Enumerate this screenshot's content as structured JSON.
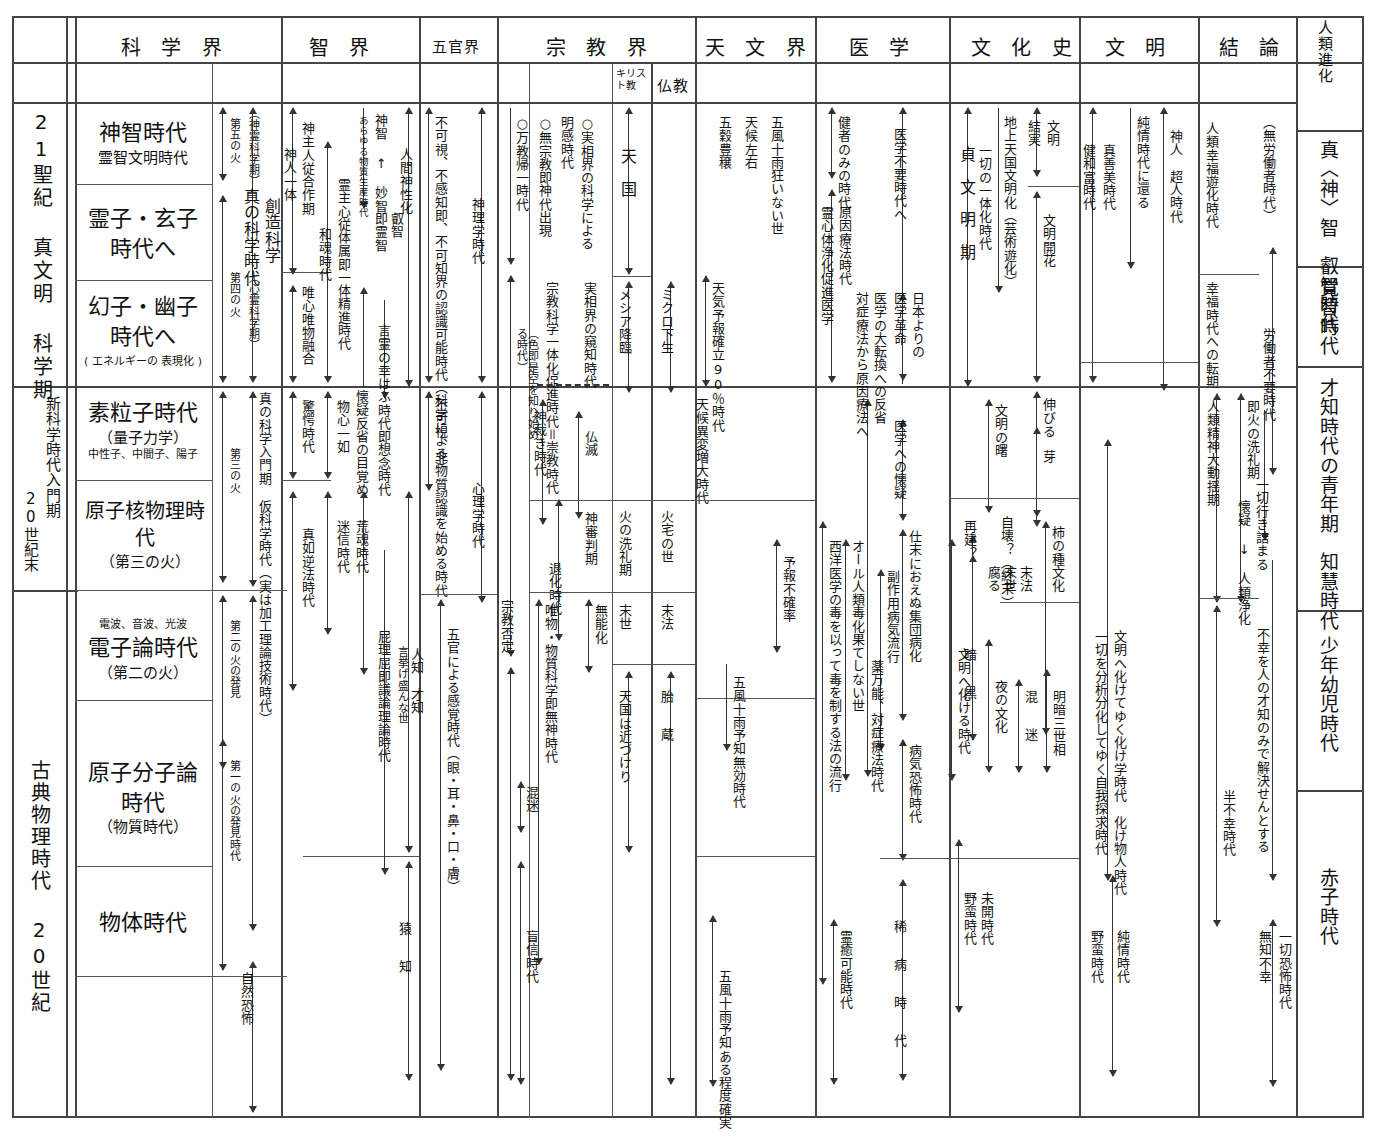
{
  "chart_title": "人類進化・文明段階比較年表",
  "columns": {
    "era_left": "",
    "headers": [
      {
        "id": "science",
        "label": "科 学 界"
      },
      {
        "id": "wisdom",
        "label": "智   界"
      },
      {
        "id": "senses",
        "label": "五官界"
      },
      {
        "id": "religion",
        "label": "宗 教 界"
      },
      {
        "id": "astronomy",
        "label": "天 文 界"
      },
      {
        "id": "medicine",
        "label": "医 学"
      },
      {
        "id": "culture",
        "label": "文 化 史"
      },
      {
        "id": "civilization",
        "label": "文 明"
      },
      {
        "id": "conclusion",
        "label": "結 論"
      },
      {
        "id": "evolution",
        "label": "人類進化"
      }
    ],
    "sub_headers": [
      {
        "id": "christianity",
        "label": "キリスト教"
      },
      {
        "id": "buddhism",
        "label": "仏教"
      }
    ]
  },
  "era_column": {
    "rows": [
      {
        "id": "era-21c",
        "label": "21聖紀 真文明 科学期"
      },
      {
        "id": "era-new-science",
        "label": "新科学時代入門期"
      },
      {
        "id": "era-20c-end",
        "label": "20世紀末"
      },
      {
        "id": "era-classical",
        "label": "古典物理時代  20世紀"
      }
    ]
  },
  "science_column": {
    "cells": [
      {
        "id": "sc-1",
        "l1": "神智時代",
        "l2": "霊智文明時代",
        "l3": ""
      },
      {
        "id": "sc-2",
        "l1": "霊子・玄子",
        "l1b": "時代へ",
        "l2": "",
        "l3": ""
      },
      {
        "id": "sc-3",
        "l1": "幻子・幽子",
        "l1b": "時代へ",
        "l3": "( エネルギーの 表現化 )"
      },
      {
        "id": "sc-4",
        "l1": "素粒子時代",
        "l2": "（量子力学）",
        "l3": "中性子、中間子、陽子"
      },
      {
        "id": "sc-5",
        "l1": "原子核物理時代",
        "l2": "（第三の火）",
        "l3": ""
      },
      {
        "id": "sc-6",
        "l1": "電子論時代",
        "l2": "（第二の火）",
        "l3": "電波、音波、光波"
      },
      {
        "id": "sc-7",
        "l1": "原子分子論",
        "l1b": "時代",
        "l2": "（物質時代）",
        "l3": ""
      },
      {
        "id": "sc-8",
        "l1": "物体時代",
        "l2": "",
        "l3": ""
      }
    ],
    "annotations": [
      {
        "id": "sc-a1",
        "text": "第五の火"
      },
      {
        "id": "sc-a2",
        "text": "（神霊科学期）"
      },
      {
        "id": "sc-a3",
        "text": "第四の火"
      },
      {
        "id": "sc-a4",
        "text": "（心霊科学期）"
      },
      {
        "id": "sc-a5",
        "text": "第三の火"
      },
      {
        "id": "sc-a6",
        "text": "第二の火の発見"
      },
      {
        "id": "sc-a7",
        "text": "第一の火の発見時代"
      },
      {
        "id": "sc-a8",
        "text": "真の科学時代"
      },
      {
        "id": "sc-a9",
        "text": "創造科学"
      },
      {
        "id": "sc-a10",
        "text": "真の科学入門期"
      },
      {
        "id": "sc-a11",
        "text": "仮科学時代（実は加工理論技術時代）"
      },
      {
        "id": "sc-a12",
        "text": "自然恐怖"
      }
    ]
  },
  "wisdom_column": {
    "annotations": [
      {
        "id": "wi-1",
        "text": "神人一体"
      },
      {
        "id": "wi-2",
        "text": "神主人従合作期"
      },
      {
        "id": "wi-3",
        "text": "唯心唯物融合"
      },
      {
        "id": "wi-4",
        "text": "和魂時代"
      },
      {
        "id": "wi-5",
        "text": "霊主心従体属即一体精進時代"
      },
      {
        "id": "wi-6",
        "text": "あらゆる物質生産時代"
      },
      {
        "id": "wi-7",
        "text": "神智 ↑ 妙智"
      },
      {
        "id": "wi-8",
        "text": "即霊智"
      },
      {
        "id": "wi-9",
        "text": "叡智"
      },
      {
        "id": "wi-10",
        "text": "言霊の幸はふ時代即想念時代"
      },
      {
        "id": "wi-11",
        "text": "人間神性化"
      },
      {
        "id": "wi-12",
        "text": "驚愕時代"
      },
      {
        "id": "wi-13",
        "text": "物心一如"
      },
      {
        "id": "wi-14",
        "text": "懐疑反省の目覚め"
      },
      {
        "id": "wi-15",
        "text": "真如逆法時代"
      },
      {
        "id": "wi-16",
        "text": "迷信時代"
      },
      {
        "id": "wi-17",
        "text": "荒魂時代"
      },
      {
        "id": "wi-18",
        "text": "屁理屈即議論理論時代"
      },
      {
        "id": "wi-19",
        "text": "言挙げ盛んな世"
      },
      {
        "id": "wi-20",
        "text": "人知　才知"
      },
      {
        "id": "wi-21",
        "text": "猿　知"
      }
    ]
  },
  "senses_column": {
    "annotations": [
      {
        "id": "se-1",
        "text": "不可視、不感知即、不可知界の認識可能時代（科学による）"
      },
      {
        "id": "se-2",
        "text": "神理学時代"
      },
      {
        "id": "se-3",
        "text": "人間神性化"
      },
      {
        "id": "se-4",
        "text": "不可視、非物質認識を始める時代"
      },
      {
        "id": "se-5",
        "text": "心理学時代"
      },
      {
        "id": "se-6",
        "text": "五官による感覚時代（眼・耳・鼻・口・膚）"
      }
    ]
  },
  "religion_column": {
    "annotations": [
      {
        "id": "re-1",
        "text": "○万教帰一時代"
      },
      {
        "id": "re-2",
        "text": "○無宗教即神代出現"
      },
      {
        "id": "re-3",
        "text": "明感時代"
      },
      {
        "id": "re-4",
        "text": "○実相界の科学による"
      },
      {
        "id": "re-5",
        "text": "宗教科学一体化促進時代＝崇教時代"
      },
      {
        "id": "re-6",
        "text": "実相界の窺知時代"
      },
      {
        "id": "re-7",
        "text": "（色即是空を知り始める時代）"
      },
      {
        "id": "re-8",
        "text": "神裁き時代"
      },
      {
        "id": "re-9",
        "text": "仏滅"
      },
      {
        "id": "re-10",
        "text": "神審判期"
      },
      {
        "id": "re-11",
        "text": "退化時代"
      },
      {
        "id": "re-12",
        "text": "無能化"
      },
      {
        "id": "re-13",
        "text": "唯物・物質科学即無神時代"
      },
      {
        "id": "re-14",
        "text": "宗教否定"
      },
      {
        "id": "re-15",
        "text": "混迷"
      },
      {
        "id": "re-16",
        "text": "盲信時代"
      }
    ],
    "christianity": [
      {
        "id": "ch-1",
        "text": "天　国"
      },
      {
        "id": "ch-2",
        "text": "メシア降臨"
      },
      {
        "id": "ch-3",
        "text": "火の洗礼期"
      },
      {
        "id": "ch-4",
        "text": "末世"
      },
      {
        "id": "ch-5",
        "text": "天国は近づけり"
      }
    ],
    "buddhism": [
      {
        "id": "bu-1",
        "text": "ミクロ下生"
      },
      {
        "id": "bu-2",
        "text": "火宅の世"
      },
      {
        "id": "bu-3",
        "text": "末法"
      },
      {
        "id": "bu-4",
        "text": "胎　蔵"
      }
    ]
  },
  "astronomy_column": {
    "annotations": [
      {
        "id": "as-1",
        "text": "五風十雨狂いない世"
      },
      {
        "id": "as-2",
        "text": "天候左右"
      },
      {
        "id": "as-3",
        "text": "五穀豊穣"
      },
      {
        "id": "as-4",
        "text": "天気予報確立90％時代"
      },
      {
        "id": "as-5",
        "text": "天候異変増大時代"
      },
      {
        "id": "as-6",
        "text": "予報不確率"
      },
      {
        "id": "as-7",
        "text": "五風十雨予知無効時代"
      },
      {
        "id": "as-8",
        "text": "五風十雨予知ある程度確実"
      }
    ]
  },
  "medicine_column": {
    "annotations": [
      {
        "id": "me-1",
        "text": "健者のみの時代"
      },
      {
        "id": "me-2",
        "text": "霊心体浄化促進医学"
      },
      {
        "id": "me-3",
        "text": "原因療法時代"
      },
      {
        "id": "me-4",
        "text": "医学不要時代へ"
      },
      {
        "id": "me-5",
        "text": "医学革命"
      },
      {
        "id": "me-6",
        "text": "日本よりの"
      },
      {
        "id": "me-7",
        "text": "医学の大転換への反省"
      },
      {
        "id": "me-8",
        "text": "対症療法から原因療法へ"
      },
      {
        "id": "me-9",
        "text": "医学への懐疑"
      },
      {
        "id": "me-10",
        "text": "仕末におえぬ集団病化"
      },
      {
        "id": "me-11",
        "text": "副作用病気流行"
      },
      {
        "id": "me-12",
        "text": "オール人類毒化果てしない世"
      },
      {
        "id": "me-13",
        "text": "薬万能、対症療法時代"
      },
      {
        "id": "me-14",
        "text": "西洋医学の毒を以って毒を制する法の流行"
      },
      {
        "id": "me-15",
        "text": "病気恐怖時代"
      },
      {
        "id": "me-16",
        "text": "稀　病　時　代"
      },
      {
        "id": "me-17",
        "text": "霊癒可能時代"
      }
    ]
  },
  "culture_column": {
    "annotations": [
      {
        "id": "cu-1",
        "text": "貞　文　明　期"
      },
      {
        "id": "cu-2",
        "text": "一切の一体化時代"
      },
      {
        "id": "cu-3",
        "text": "地上天国文明化（芸術遊化）"
      },
      {
        "id": "cu-4",
        "text": "結実"
      },
      {
        "id": "cu-5",
        "text": "文明"
      },
      {
        "id": "cu-6",
        "text": "文明開花"
      },
      {
        "id": "cu-7",
        "text": "伸びる"
      },
      {
        "id": "cu-8",
        "text": "文明の曙"
      },
      {
        "id": "cu-9",
        "text": "芽"
      },
      {
        "id": "cu-10",
        "text": "再建？"
      },
      {
        "id": "cu-11",
        "text": "自壊？（終末）"
      },
      {
        "id": "cu-12",
        "text": "柿の種文化"
      },
      {
        "id": "cu-13",
        "text": "腐る"
      },
      {
        "id": "cu-14",
        "text": "末世"
      },
      {
        "id": "cu-15",
        "text": "末法"
      },
      {
        "id": "cu-16",
        "text": "暗　黒"
      },
      {
        "id": "cu-17",
        "text": "文明へ化ける時代"
      },
      {
        "id": "cu-18",
        "text": "夜の文化"
      },
      {
        "id": "cu-19",
        "text": "混　迷"
      },
      {
        "id": "cu-20",
        "text": "明暗三世相"
      },
      {
        "id": "cu-21",
        "text": "未開時代"
      },
      {
        "id": "cu-22",
        "text": "野蛮時代"
      }
    ]
  },
  "civilization_column": {
    "annotations": [
      {
        "id": "ci-1",
        "text": "健和富時代"
      },
      {
        "id": "ci-2",
        "text": "真善美時代"
      },
      {
        "id": "ci-3",
        "text": "純情時代に還る"
      },
      {
        "id": "ci-4",
        "text": "神人　超人時代"
      },
      {
        "id": "ci-5",
        "text": "文明へ化けてゆく化け学時代　化け物人時代"
      },
      {
        "id": "ci-6",
        "text": "一切を分析分化してゆく自我探求時代"
      },
      {
        "id": "ci-7",
        "text": "野蛮時代"
      },
      {
        "id": "ci-8",
        "text": "純情時代"
      }
    ]
  },
  "conclusion_column": {
    "annotations": [
      {
        "id": "co-1",
        "text": "人類幸福遊化時代"
      },
      {
        "id": "co-2",
        "text": "（無労働者時代）"
      },
      {
        "id": "co-3",
        "text": "幸福時代への転期"
      },
      {
        "id": "co-4",
        "text": "労働者不要時代"
      },
      {
        "id": "co-5",
        "text": "即火の洗礼期"
      },
      {
        "id": "co-6",
        "text": "人類精神大動揺期"
      },
      {
        "id": "co-7",
        "text": "一切行き詰まる"
      },
      {
        "id": "co-8",
        "text": "懐疑 ↓ 人類浄化"
      },
      {
        "id": "co-9",
        "text": "半不幸時代"
      },
      {
        "id": "co-10",
        "text": "不幸を人の才知のみで解決せんとする"
      },
      {
        "id": "co-11",
        "text": "一切恐怖時代"
      },
      {
        "id": "co-12",
        "text": "無知不幸"
      }
    ]
  },
  "evolution_column": {
    "cells": [
      {
        "id": "ev-1",
        "text": "真〈神〉智　叡智時代"
      },
      {
        "id": "ev-2",
        "text": "覚智時代"
      },
      {
        "id": "ev-3",
        "text": "才知時代の青年期　知慧時代"
      },
      {
        "id": "ev-4",
        "text": "少年幼児時代"
      },
      {
        "id": "ev-5",
        "text": "赤子時代"
      }
    ]
  },
  "colors": {
    "ink": "#111111",
    "rule": "#555555",
    "frame": "#444444",
    "paper": "#ffffff"
  }
}
